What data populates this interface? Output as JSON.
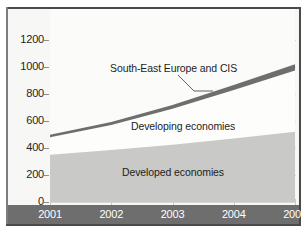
{
  "chart_data": {
    "type": "area",
    "title": "",
    "subtitle": "",
    "xlabel": "",
    "ylabel": "",
    "x": [
      2001,
      2002,
      2003,
      2004,
      2005
    ],
    "categories": [
      "2001",
      "2002",
      "2003",
      "2004",
      "2005"
    ],
    "xtick_labels": [
      "2001",
      "2002",
      "2003",
      "2004",
      "2005"
    ],
    "ytick_labels": [
      "0",
      "200",
      "400",
      "600",
      "800",
      "1000",
      "1200"
    ],
    "ytick_values": [
      0,
      200,
      400,
      600,
      800,
      1000,
      1200
    ],
    "ylim": [
      0,
      1250
    ],
    "xlim": [
      2001,
      2005
    ],
    "grid": true,
    "legend": "inline-annotations",
    "stacked": true,
    "series": [
      {
        "name": "Developed economies",
        "values": [
          350,
          385,
          425,
          470,
          520
        ],
        "color": "#c9c9c7"
      },
      {
        "name": "Developing economies",
        "values": [
          130,
          185,
          265,
          360,
          455
        ],
        "cumulative": [
          480,
          570,
          690,
          830,
          975
        ],
        "color": "#fdfdfc"
      },
      {
        "name": "South-East Europe and CIS",
        "values": [
          18,
          22,
          28,
          36,
          45
        ],
        "cumulative": [
          498,
          592,
          718,
          866,
          1020
        ],
        "color": "#6e6e6e"
      }
    ],
    "annotations": [
      {
        "text": "South-East Europe and CIS",
        "target_series": "South-East Europe and CIS",
        "leader": true
      },
      {
        "text": "Developing economies",
        "target_series": "Developing economies",
        "leader": false
      },
      {
        "text": "Developed economies",
        "target_series": "Developed economies",
        "leader": false
      }
    ]
  },
  "colors": {
    "developed_fill": "#c9c9c7",
    "developing_fill": "#fdfdfc",
    "cis_fill": "#6e6e6e",
    "axis_band": "#6e6e6e",
    "frame": "#4a4a4a",
    "gridline": "#d8d8d6",
    "plot_bg": "#f7f7f5",
    "tick_text": "#242424",
    "xtick_text": "#ffffff"
  }
}
